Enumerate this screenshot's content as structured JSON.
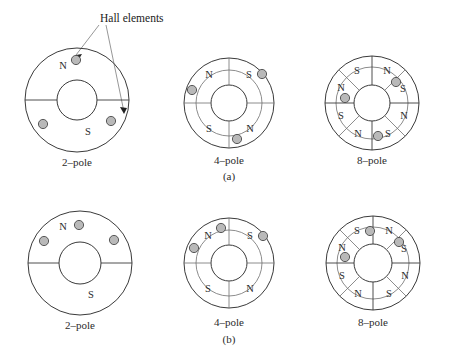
{
  "figure": {
    "annotation_label": "Hall elements",
    "row_captions": [
      {
        "id": "a",
        "text": "(a)"
      },
      {
        "id": "b",
        "text": "(b)"
      }
    ],
    "pole_letters": {
      "north": "N",
      "south": "S"
    },
    "diagrams": [
      {
        "row": "a",
        "id": "a-2-pole",
        "caption": "2–pole",
        "poles": 2,
        "sectors": [
          {
            "label": "N",
            "position": "top"
          },
          {
            "label": "S",
            "position": "bottom"
          }
        ],
        "hall_elements": [
          {
            "position": "top-center"
          },
          {
            "position": "lower-left"
          },
          {
            "position": "lower-right"
          }
        ]
      },
      {
        "row": "a",
        "id": "a-4-pole",
        "caption": "4–pole",
        "poles": 4,
        "sectors": [
          {
            "label": "N",
            "position": "top-left"
          },
          {
            "label": "S",
            "position": "top-right"
          },
          {
            "label": "N",
            "position": "bottom-right"
          },
          {
            "label": "S",
            "position": "bottom-left"
          }
        ],
        "hall_elements": [
          {
            "position": "left"
          },
          {
            "position": "top-right"
          },
          {
            "position": "bottom-center"
          }
        ]
      },
      {
        "row": "a",
        "id": "a-8-pole",
        "caption": "8–pole",
        "poles": 8,
        "sectors": [
          {
            "label": "S",
            "position": "top-left-inner"
          },
          {
            "label": "N",
            "position": "top-right-inner"
          },
          {
            "label": "S",
            "position": "right-upper"
          },
          {
            "label": "N",
            "position": "right-lower"
          },
          {
            "label": "S",
            "position": "bottom-right-inner"
          },
          {
            "label": "N",
            "position": "bottom-left-inner"
          },
          {
            "label": "S",
            "position": "left-lower"
          },
          {
            "label": "N",
            "position": "left-upper"
          }
        ],
        "hall_elements": [
          {
            "position": "left-upper"
          },
          {
            "position": "right-upper"
          },
          {
            "position": "bottom-right-inner"
          }
        ]
      },
      {
        "row": "b",
        "id": "b-2-pole",
        "caption": "2–pole",
        "poles": 2,
        "sectors": [
          {
            "label": "N",
            "position": "top"
          },
          {
            "label": "S",
            "position": "bottom"
          }
        ],
        "hall_elements": [
          {
            "position": "top-center"
          },
          {
            "position": "upper-left"
          },
          {
            "position": "upper-right"
          }
        ]
      },
      {
        "row": "b",
        "id": "b-4-pole",
        "caption": "4–pole",
        "poles": 4,
        "sectors": [
          {
            "label": "N",
            "position": "top-left"
          },
          {
            "label": "S",
            "position": "top-right"
          },
          {
            "label": "N",
            "position": "bottom-right"
          },
          {
            "label": "S",
            "position": "bottom-left"
          }
        ],
        "hall_elements": [
          {
            "position": "top-center"
          },
          {
            "position": "upper-left"
          },
          {
            "position": "top-right"
          }
        ]
      },
      {
        "row": "b",
        "id": "b-8-pole",
        "caption": "8–pole",
        "poles": 8,
        "sectors": [
          {
            "label": "S",
            "position": "top-left-inner"
          },
          {
            "label": "N",
            "position": "top-right-inner"
          },
          {
            "label": "S",
            "position": "right-upper"
          },
          {
            "label": "N",
            "position": "right-lower"
          },
          {
            "label": "S",
            "position": "bottom-right-inner"
          },
          {
            "label": "N",
            "position": "bottom-left-inner"
          },
          {
            "label": "S",
            "position": "left-lower"
          },
          {
            "label": "N",
            "position": "left-upper"
          }
        ],
        "hall_elements": [
          {
            "position": "top-center"
          },
          {
            "position": "left-upper"
          },
          {
            "position": "right-upper"
          }
        ]
      }
    ],
    "colors": {
      "hall_fill": "#b9b9b9",
      "hall_stroke": "#4a4a4a",
      "outline": "#3a3a3a",
      "spoke": "#6e6e6e",
      "text": "#2b2b2b",
      "background": "#ffffff"
    }
  }
}
